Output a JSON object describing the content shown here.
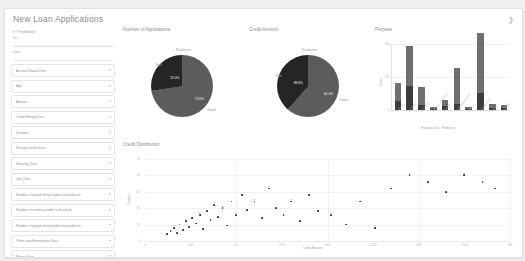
{
  "app": {
    "title": "New Loan Applications",
    "collapse_icon": "chevron-right-icon"
  },
  "sidebar": {
    "header": {
      "label": "Prediction",
      "chevron": "chevron-down-icon"
    },
    "text_fields": [
      {
        "label": "No.",
        "value": ""
      },
      {
        "label": "Name",
        "value": ""
      }
    ],
    "dropdowns": [
      {
        "label": "Account Status Desc",
        "caret": "caret-down-icon"
      },
      {
        "label": "Age",
        "caret": "caret-down-icon"
      },
      {
        "label": "Amount",
        "caret": "caret-down-icon"
      },
      {
        "label": "Credit History Desc",
        "caret": "caret-down-icon"
      },
      {
        "label": "Duration",
        "caret": "caret-down-icon"
      },
      {
        "label": "Foreign worker Desc",
        "caret": "caret-down-icon"
      },
      {
        "label": "Housing_Desc",
        "caret": "caret-down-icon"
      },
      {
        "label": "Job_Desc",
        "caret": "caret-down-icon"
      },
      {
        "label": "Number of people being liable to provide ma",
        "caret": "caret-down-icon"
      },
      {
        "label": "Number of existing credits at this bank",
        "caret": "caret-down-icon"
      },
      {
        "label": "Number of people being liable to provide ma",
        "caret": "caret-down-icon"
      },
      {
        "label": "Other installment plans Desc",
        "caret": "caret-down-icon"
      },
      {
        "label": "Phone Desc",
        "caret": "caret-down-icon"
      },
      {
        "label": "Present residence since",
        "caret": "caret-down-icon"
      },
      {
        "label": "Property_Desc",
        "caret": "caret-down-icon"
      }
    ],
    "footer": "..."
  },
  "charts": {
    "applications_pie": {
      "title": "Number of Applications",
      "legend_title": "Prediction",
      "outer_label": "Good",
      "inner_label": "Bad"
    },
    "amount_pie": {
      "title": "Credit Amount",
      "legend_title": "Prediction",
      "outer_label": "Good",
      "inner_label": "Bad"
    },
    "purpose_bar": {
      "title": "Purpose"
    },
    "scatter": {
      "title": "Credit Distribution"
    }
  },
  "chart_data": [
    {
      "type": "pie",
      "title": "Number of Applications",
      "legend_title": "Prediction",
      "labels": [
        "Good",
        "Bad"
      ],
      "values": [
        72.6,
        27.4
      ],
      "value_labels": [
        "72.6%",
        "27.4%"
      ],
      "colors": [
        "#5c5c5c",
        "#252525"
      ],
      "legend_position": "top"
    },
    {
      "type": "pie",
      "title": "Credit Amount",
      "legend_title": "Prediction",
      "labels": [
        "Good",
        "Bad"
      ],
      "values": [
        61.4,
        38.6
      ],
      "value_labels": [
        "61.4%",
        "38.6%"
      ],
      "colors": [
        "#5c5c5c",
        "#252525"
      ],
      "legend_position": "top"
    },
    {
      "type": "bar",
      "title": "Purpose",
      "xlabel": "Purpose Desc, Prediction",
      "ylabel": "Count",
      "ylim": [
        0,
        240
      ],
      "yticks": [
        0,
        120,
        240
      ],
      "ytick_labels": [
        "0",
        "120",
        "240"
      ],
      "grid": true,
      "stacked": true,
      "categories": [
        "business",
        "car (new)",
        "car (used)",
        "domestic appliances",
        "education",
        "furniture/equipment",
        "others",
        "radio/television",
        "repairs",
        "retraining"
      ],
      "series": [
        {
          "name": "Bad",
          "values": [
            34,
            89,
            17,
            5,
            14,
            22,
            4,
            62,
            9,
            8
          ]
        },
        {
          "name": "Good",
          "values": [
            63,
            145,
            66,
            7,
            22,
            132,
            7,
            218,
            13,
            12
          ]
        }
      ]
    },
    {
      "type": "scatter",
      "title": "Credit Distribution",
      "xlabel": "Credit Amount",
      "ylabel": "Duration",
      "xlim": [
        0,
        20000
      ],
      "ylim": [
        0,
        75
      ],
      "xticks": [
        0,
        2500,
        5000,
        7500,
        10000,
        12500,
        15000,
        17500,
        20000
      ],
      "xtick_labels": [
        "0",
        "2.5K",
        "5K",
        "7.5K",
        "10K",
        "12.5K",
        "15K",
        "17.5K",
        "20K"
      ],
      "yticks": [
        0,
        15,
        30,
        45,
        60,
        75
      ],
      "ytick_labels": [
        "0",
        "15",
        "30",
        "45",
        "60",
        "75"
      ],
      "grid": true,
      "points": [
        {
          "x": 1200,
          "y": 6,
          "label": ""
        },
        {
          "x": 1400,
          "y": 9,
          "label": ""
        },
        {
          "x": 1600,
          "y": 12,
          "label": "12"
        },
        {
          "x": 1750,
          "y": 7,
          "label": ""
        },
        {
          "x": 1900,
          "y": 15,
          "label": ""
        },
        {
          "x": 2100,
          "y": 10,
          "label": ""
        },
        {
          "x": 2250,
          "y": 18,
          "label": "18"
        },
        {
          "x": 2400,
          "y": 13,
          "label": ""
        },
        {
          "x": 2600,
          "y": 21,
          "label": ""
        },
        {
          "x": 2800,
          "y": 16,
          "label": ""
        },
        {
          "x": 3000,
          "y": 24,
          "label": "24"
        },
        {
          "x": 3200,
          "y": 11,
          "label": ""
        },
        {
          "x": 3400,
          "y": 27,
          "label": ""
        },
        {
          "x": 3600,
          "y": 19,
          "label": ""
        },
        {
          "x": 3800,
          "y": 33,
          "label": "33"
        },
        {
          "x": 4000,
          "y": 22,
          "label": ""
        },
        {
          "x": 4250,
          "y": 30,
          "label": "30"
        },
        {
          "x": 4500,
          "y": 14,
          "label": ""
        },
        {
          "x": 4750,
          "y": 36,
          "label": ""
        },
        {
          "x": 5000,
          "y": 24,
          "label": "24"
        },
        {
          "x": 5300,
          "y": 42,
          "label": ""
        },
        {
          "x": 5600,
          "y": 28,
          "label": ""
        },
        {
          "x": 6000,
          "y": 36,
          "label": "36"
        },
        {
          "x": 6400,
          "y": 21,
          "label": ""
        },
        {
          "x": 6800,
          "y": 48,
          "label": "48"
        },
        {
          "x": 7200,
          "y": 30,
          "label": ""
        },
        {
          "x": 7600,
          "y": 24,
          "label": ""
        },
        {
          "x": 8000,
          "y": 36,
          "label": "36"
        },
        {
          "x": 8500,
          "y": 18,
          "label": ""
        },
        {
          "x": 9000,
          "y": 42,
          "label": ""
        },
        {
          "x": 9500,
          "y": 27,
          "label": ""
        },
        {
          "x": 10200,
          "y": 24,
          "label": "24"
        },
        {
          "x": 11000,
          "y": 15,
          "label": ""
        },
        {
          "x": 11800,
          "y": 36,
          "label": ""
        },
        {
          "x": 12600,
          "y": 12,
          "label": "12"
        },
        {
          "x": 13500,
          "y": 48,
          "label": ""
        },
        {
          "x": 14500,
          "y": 60,
          "label": "60"
        },
        {
          "x": 15500,
          "y": 54,
          "label": ""
        },
        {
          "x": 16500,
          "y": 45,
          "label": ""
        },
        {
          "x": 17500,
          "y": 60,
          "label": "60"
        },
        {
          "x": 18500,
          "y": 54,
          "label": ""
        },
        {
          "x": 19200,
          "y": 48,
          "label": ""
        }
      ]
    }
  ]
}
